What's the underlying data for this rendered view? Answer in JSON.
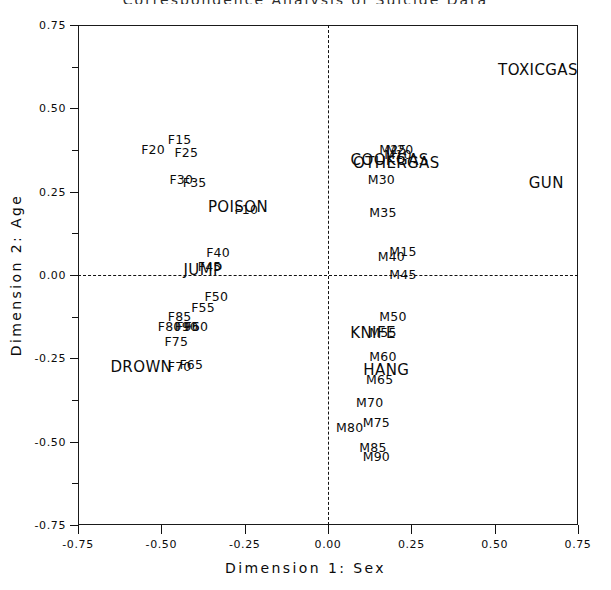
{
  "chart_title": "Correspondence Analysis of Suicide Data",
  "axes": {
    "xlabel": "Dimension 1: Sex",
    "ylabel": "Dimension 2: Age",
    "xticks": [
      "-0.75",
      "-0.50",
      "-0.25",
      "0.00",
      "0.25",
      "0.50",
      "0.75"
    ],
    "yticks": [
      "0.75",
      "0.50",
      "0.25",
      "0.00",
      "-0.25",
      "-0.50",
      "-0.75"
    ],
    "xlim": [
      -0.75,
      0.75
    ],
    "ylim": [
      -0.75,
      0.75
    ],
    "grid": false,
    "zero_lines": "dashed"
  },
  "chart_data": {
    "type": "scatter",
    "title": "Correspondence Analysis of Suicide Data",
    "xlabel": "Dimension 1: Sex",
    "ylabel": "Dimension 2: Age",
    "xlim": [
      -0.75,
      0.75
    ],
    "ylim": [
      -0.75,
      0.75
    ],
    "marker": "text-label",
    "legend": "none",
    "series": [
      {
        "name": "Method (columns)",
        "style": "cat",
        "points": [
          {
            "label": "TOXICGAS",
            "x": 0.63,
            "y": 0.615
          },
          {
            "label": "GUN",
            "x": 0.655,
            "y": 0.275
          },
          {
            "label": "POISON",
            "x": -0.27,
            "y": 0.205
          },
          {
            "label": "JUMP",
            "x": -0.375,
            "y": 0.015
          },
          {
            "label": "DROWN",
            "x": -0.56,
            "y": -0.275
          },
          {
            "label": "KNIFE",
            "x": 0.135,
            "y": -0.175
          },
          {
            "label": "HANG",
            "x": 0.175,
            "y": -0.285
          },
          {
            "label": "COOKGAS",
            "x": 0.185,
            "y": 0.345
          },
          {
            "label": "OTHERGAS",
            "x": 0.205,
            "y": 0.335
          }
        ]
      },
      {
        "name": "Female age groups",
        "style": "grp",
        "points": [
          {
            "label": "F10",
            "x": -0.245,
            "y": 0.195
          },
          {
            "label": "F15",
            "x": -0.445,
            "y": 0.405
          },
          {
            "label": "F20",
            "x": -0.525,
            "y": 0.375
          },
          {
            "label": "F25",
            "x": -0.425,
            "y": 0.365
          },
          {
            "label": "F30",
            "x": -0.44,
            "y": 0.285
          },
          {
            "label": "F35",
            "x": -0.4,
            "y": 0.275
          },
          {
            "label": "F40",
            "x": -0.33,
            "y": 0.065
          },
          {
            "label": "F45",
            "x": -0.355,
            "y": 0.025
          },
          {
            "label": "F50",
            "x": -0.335,
            "y": -0.065
          },
          {
            "label": "F55",
            "x": -0.375,
            "y": -0.1
          },
          {
            "label": "F60",
            "x": -0.395,
            "y": -0.155
          },
          {
            "label": "F65",
            "x": -0.41,
            "y": -0.27
          },
          {
            "label": "F70",
            "x": -0.445,
            "y": -0.275
          },
          {
            "label": "F75",
            "x": -0.455,
            "y": -0.2
          },
          {
            "label": "F80",
            "x": -0.475,
            "y": -0.155
          },
          {
            "label": "F85",
            "x": -0.445,
            "y": -0.125
          },
          {
            "label": "F90",
            "x": -0.425,
            "y": -0.155
          },
          {
            "label": "F95",
            "x": -0.42,
            "y": -0.155
          }
        ]
      },
      {
        "name": "Male age groups",
        "style": "grp",
        "points": [
          {
            "label": "M10",
            "x": 0.21,
            "y": 0.36
          },
          {
            "label": "M15",
            "x": 0.225,
            "y": 0.07
          },
          {
            "label": "M20",
            "x": 0.215,
            "y": 0.375
          },
          {
            "label": "M25",
            "x": 0.195,
            "y": 0.375
          },
          {
            "label": "M30",
            "x": 0.16,
            "y": 0.285
          },
          {
            "label": "M35",
            "x": 0.165,
            "y": 0.185
          },
          {
            "label": "M40",
            "x": 0.19,
            "y": 0.055
          },
          {
            "label": "M45",
            "x": 0.225,
            "y": 0.0
          },
          {
            "label": "M50",
            "x": 0.195,
            "y": -0.125
          },
          {
            "label": "M55",
            "x": 0.165,
            "y": -0.175
          },
          {
            "label": "M60",
            "x": 0.165,
            "y": -0.245
          },
          {
            "label": "M65",
            "x": 0.155,
            "y": -0.315
          },
          {
            "label": "M70",
            "x": 0.125,
            "y": -0.385
          },
          {
            "label": "M75",
            "x": 0.145,
            "y": -0.445
          },
          {
            "label": "M80",
            "x": 0.065,
            "y": -0.46
          },
          {
            "label": "M85",
            "x": 0.135,
            "y": -0.52
          },
          {
            "label": "M90",
            "x": 0.145,
            "y": -0.545
          }
        ]
      }
    ]
  }
}
